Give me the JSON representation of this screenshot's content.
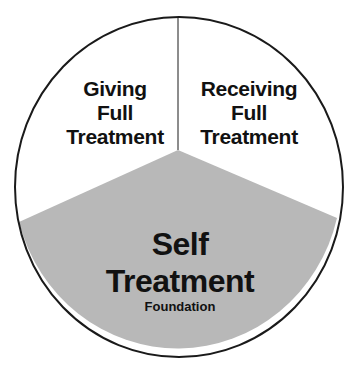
{
  "diagram": {
    "type": "pie-segments",
    "colors": {
      "background": "#ffffff",
      "outline": "#1a1a1a",
      "foundation_fill": "#b8b8b8",
      "text": "#111111"
    },
    "segments": [
      {
        "id": "giving",
        "lines": [
          "Giving",
          "Full",
          "Treatment"
        ]
      },
      {
        "id": "receiving",
        "lines": [
          "Receiving",
          "Full",
          "Treatment"
        ]
      },
      {
        "id": "self",
        "lines": [
          "Self",
          "Treatment"
        ],
        "sublabel": "Foundation"
      }
    ]
  }
}
